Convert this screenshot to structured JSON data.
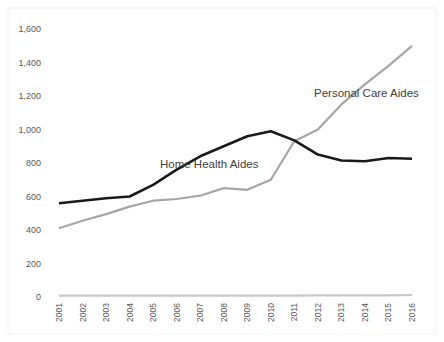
{
  "chart_data": {
    "type": "line",
    "title": "",
    "xlabel": "",
    "ylabel": "",
    "ylim": [
      0,
      1600
    ],
    "yticks": [
      0,
      200,
      400,
      600,
      800,
      1000,
      1200,
      1400,
      1600
    ],
    "ytick_labels": [
      "0",
      "200",
      "400",
      "600",
      "800",
      "1,000",
      "1,200",
      "1,400",
      "1,600"
    ],
    "x": [
      "2001",
      "2002",
      "2003",
      "2004",
      "2005",
      "2006",
      "2007",
      "2008",
      "2009",
      "2010",
      "2011",
      "2012",
      "2013",
      "2014",
      "2015",
      "2016"
    ],
    "grid": false,
    "legend": "none (inline annotations)",
    "series": [
      {
        "name": "Home Health Aides",
        "color": "#1a1a1a",
        "values": [
          560,
          575,
          590,
          600,
          670,
          760,
          840,
          900,
          960,
          990,
          935,
          850,
          815,
          810,
          830,
          825
        ]
      },
      {
        "name": "Personal Care Aides",
        "color": "#a6a6a6",
        "values": [
          410,
          455,
          495,
          540,
          575,
          585,
          605,
          650,
          640,
          700,
          930,
          1000,
          1150,
          1270,
          1380,
          1500
        ]
      },
      {
        "name": "(baseline series)",
        "color": "#c8c8c8",
        "values": [
          8,
          8,
          8,
          8,
          8,
          8,
          8,
          8,
          8,
          8,
          8,
          10,
          10,
          10,
          10,
          12
        ]
      }
    ],
    "annotations": [
      {
        "text": "Home Health Aides",
        "near": "2007",
        "y": 800
      },
      {
        "text": "Personal Care Aides",
        "near": "2014",
        "y": 1180
      }
    ]
  }
}
